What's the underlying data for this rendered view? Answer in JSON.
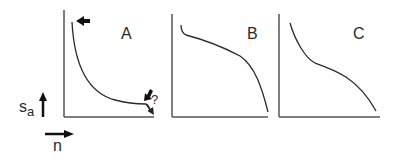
{
  "diagram": {
    "panels": [
      {
        "id": "A",
        "label": "A",
        "annotation": "?"
      },
      {
        "id": "B",
        "label": "B"
      },
      {
        "id": "C",
        "label": "C"
      }
    ],
    "axes": {
      "y_label": "s",
      "y_subscript": "a",
      "x_label": "n"
    },
    "colors": {
      "line": "#2a2a2a",
      "axis": "#555555",
      "background": "#ffffff"
    }
  }
}
